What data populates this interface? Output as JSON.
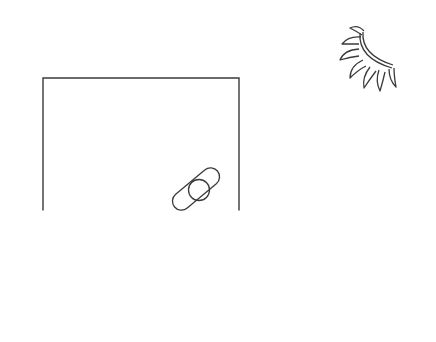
{
  "canvas": {
    "width": 436,
    "height": 342,
    "background": "#ffffff",
    "stroke_color": "#3a3a3a"
  },
  "drawing": {
    "elements": [
      {
        "name": "open-box-outline",
        "shape": "open-rectangle",
        "left": 43,
        "right": 239,
        "top": 78,
        "bottom": 210
      },
      {
        "name": "bandage-shape",
        "shape": "capsule-with-circle",
        "center": [
          193,
          188
        ]
      },
      {
        "name": "sun-icon",
        "shape": "half-sun-with-rays",
        "center": [
          385,
          35
        ]
      }
    ]
  }
}
